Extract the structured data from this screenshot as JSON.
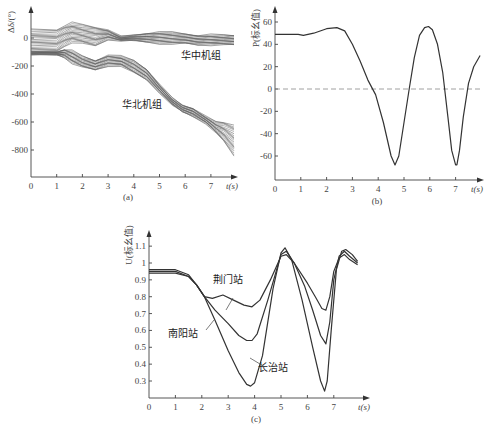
{
  "chart_data": [
    {
      "id": "a",
      "type": "line",
      "caption": "(a)",
      "xlabel": "t(s)",
      "ylabel": "Δδ/(°)",
      "xticks": [
        0,
        1,
        2,
        3,
        4,
        5,
        6,
        7
      ],
      "yticks": [
        0,
        -200,
        -400,
        -600,
        -800
      ],
      "xlim": [
        0,
        8
      ],
      "ylim": [
        -1000,
        80
      ],
      "grid": false,
      "annotations": [
        {
          "text": "华中机组",
          "x": 6.6,
          "y": -150
        },
        {
          "text": "华北机组",
          "x": 4.3,
          "y": -500
        }
      ],
      "series": [
        {
          "name": "华中机组",
          "band": true,
          "x": [
            0,
            1,
            1.3,
            1.6,
            2,
            2.5,
            3,
            3.5,
            4,
            4.5,
            5,
            5.5,
            6,
            6.5,
            7,
            7.5,
            7.9
          ],
          "upper": [
            60,
            60,
            90,
            110,
            95,
            80,
            60,
            10,
            20,
            35,
            45,
            40,
            30,
            20,
            25,
            20,
            20
          ],
          "lower": [
            -100,
            -100,
            -60,
            -30,
            -40,
            -60,
            -10,
            -20,
            -20,
            -30,
            -40,
            -45,
            -40,
            -50,
            -50,
            -50,
            -50
          ]
        },
        {
          "name": "华北机组",
          "band": true,
          "x": [
            0,
            1,
            1.3,
            1.6,
            2,
            2.5,
            3,
            3.5,
            4,
            4.5,
            5,
            5.5,
            5.9,
            6.3,
            6.8,
            7.2,
            7.5,
            7.9
          ],
          "upper": [
            -100,
            -100,
            -80,
            -90,
            -130,
            -160,
            -120,
            -130,
            -160,
            -220,
            -330,
            -430,
            -480,
            -500,
            -560,
            -600,
            -600,
            -620
          ],
          "lower": [
            -120,
            -120,
            -140,
            -180,
            -210,
            -230,
            -200,
            -200,
            -250,
            -300,
            -390,
            -480,
            -530,
            -560,
            -610,
            -680,
            -740,
            -840
          ]
        }
      ]
    },
    {
      "id": "b",
      "type": "line",
      "caption": "(b)",
      "xlabel": "t(s)",
      "ylabel": "P(标幺值)",
      "xticks": [
        0,
        1,
        2,
        3,
        4,
        5,
        6,
        7
      ],
      "yticks": [
        60,
        40,
        20,
        0,
        -20,
        -40,
        -60
      ],
      "xlim": [
        0,
        8
      ],
      "ylim": [
        -75,
        70
      ],
      "grid": false,
      "reference_line": {
        "y": 0,
        "style": "dashed"
      },
      "series": [
        {
          "name": "P",
          "x": [
            0,
            0.9,
            1.1,
            1.5,
            2,
            2.4,
            2.7,
            3,
            3.3,
            3.6,
            3.9,
            4.2,
            4.5,
            4.65,
            4.8,
            5,
            5.2,
            5.4,
            5.6,
            5.8,
            5.95,
            6.1,
            6.3,
            6.5,
            6.7,
            6.85,
            7.0,
            7.05,
            7.15,
            7.3,
            7.5,
            7.7,
            7.95
          ],
          "y": [
            49,
            49,
            48,
            50,
            54,
            55,
            52,
            40,
            25,
            8,
            -5,
            -30,
            -60,
            -68,
            -60,
            -30,
            0,
            28,
            48,
            55,
            56,
            53,
            40,
            15,
            -25,
            -55,
            -68,
            -68,
            -55,
            -25,
            5,
            20,
            30
          ]
        }
      ]
    },
    {
      "id": "c",
      "type": "line",
      "caption": "(c)",
      "xlabel": "t(s)",
      "ylabel": "U(标幺值)",
      "xticks": [
        0,
        1,
        2,
        3,
        4,
        5,
        6,
        7
      ],
      "yticks": [
        1.1,
        1,
        0.9,
        0.8,
        0.7,
        0.6,
        0.5,
        0.4,
        0.3
      ],
      "xlim": [
        0,
        8.5
      ],
      "ylim": [
        0.2,
        1.18
      ],
      "grid": false,
      "annotations": [
        {
          "text": "荆门站",
          "x": 3.0,
          "y": 0.88
        },
        {
          "text": "南阳站",
          "x": 1.3,
          "y": 0.56
        },
        {
          "text": "长治站",
          "x": 4.7,
          "y": 0.36
        }
      ],
      "series": [
        {
          "name": "荆门站",
          "x": [
            0,
            1,
            1.5,
            1.8,
            2.1,
            2.4,
            2.8,
            3.2,
            3.6,
            3.9,
            4.2,
            4.6,
            5,
            5.2,
            5.5,
            6,
            6.3,
            6.55,
            6.7,
            6.85,
            7,
            7.2,
            7.4,
            7.6,
            7.9
          ],
          "y": [
            0.96,
            0.96,
            0.93,
            0.87,
            0.8,
            0.79,
            0.81,
            0.78,
            0.75,
            0.74,
            0.78,
            0.9,
            1.04,
            1.05,
            1.0,
            0.88,
            0.8,
            0.73,
            0.72,
            0.8,
            0.95,
            1.03,
            1.05,
            1.02,
            0.99
          ]
        },
        {
          "name": "南阳站",
          "x": [
            0,
            1,
            1.5,
            1.8,
            2.1,
            2.5,
            3,
            3.4,
            3.7,
            3.9,
            4.1,
            4.5,
            5,
            5.2,
            5.5,
            5.9,
            6.2,
            6.5,
            6.7,
            6.85,
            7,
            7.2,
            7.4,
            7.6,
            7.9
          ],
          "y": [
            0.95,
            0.95,
            0.92,
            0.87,
            0.8,
            0.72,
            0.64,
            0.57,
            0.54,
            0.54,
            0.58,
            0.78,
            1.05,
            1.07,
            1.0,
            0.86,
            0.72,
            0.57,
            0.52,
            0.65,
            0.9,
            1.04,
            1.07,
            1.04,
            1.0
          ]
        },
        {
          "name": "长治站",
          "x": [
            0,
            1,
            1.5,
            1.8,
            2.1,
            2.5,
            3,
            3.4,
            3.7,
            3.85,
            4.0,
            4.3,
            4.7,
            5,
            5.15,
            5.4,
            5.8,
            6.2,
            6.5,
            6.65,
            6.75,
            6.9,
            7.1,
            7.3,
            7.45,
            7.7,
            7.9
          ],
          "y": [
            0.94,
            0.94,
            0.92,
            0.87,
            0.8,
            0.66,
            0.48,
            0.35,
            0.28,
            0.27,
            0.29,
            0.45,
            0.85,
            1.06,
            1.09,
            1.02,
            0.78,
            0.5,
            0.3,
            0.24,
            0.3,
            0.6,
            0.96,
            1.07,
            1.08,
            1.05,
            1.01
          ]
        }
      ]
    }
  ]
}
